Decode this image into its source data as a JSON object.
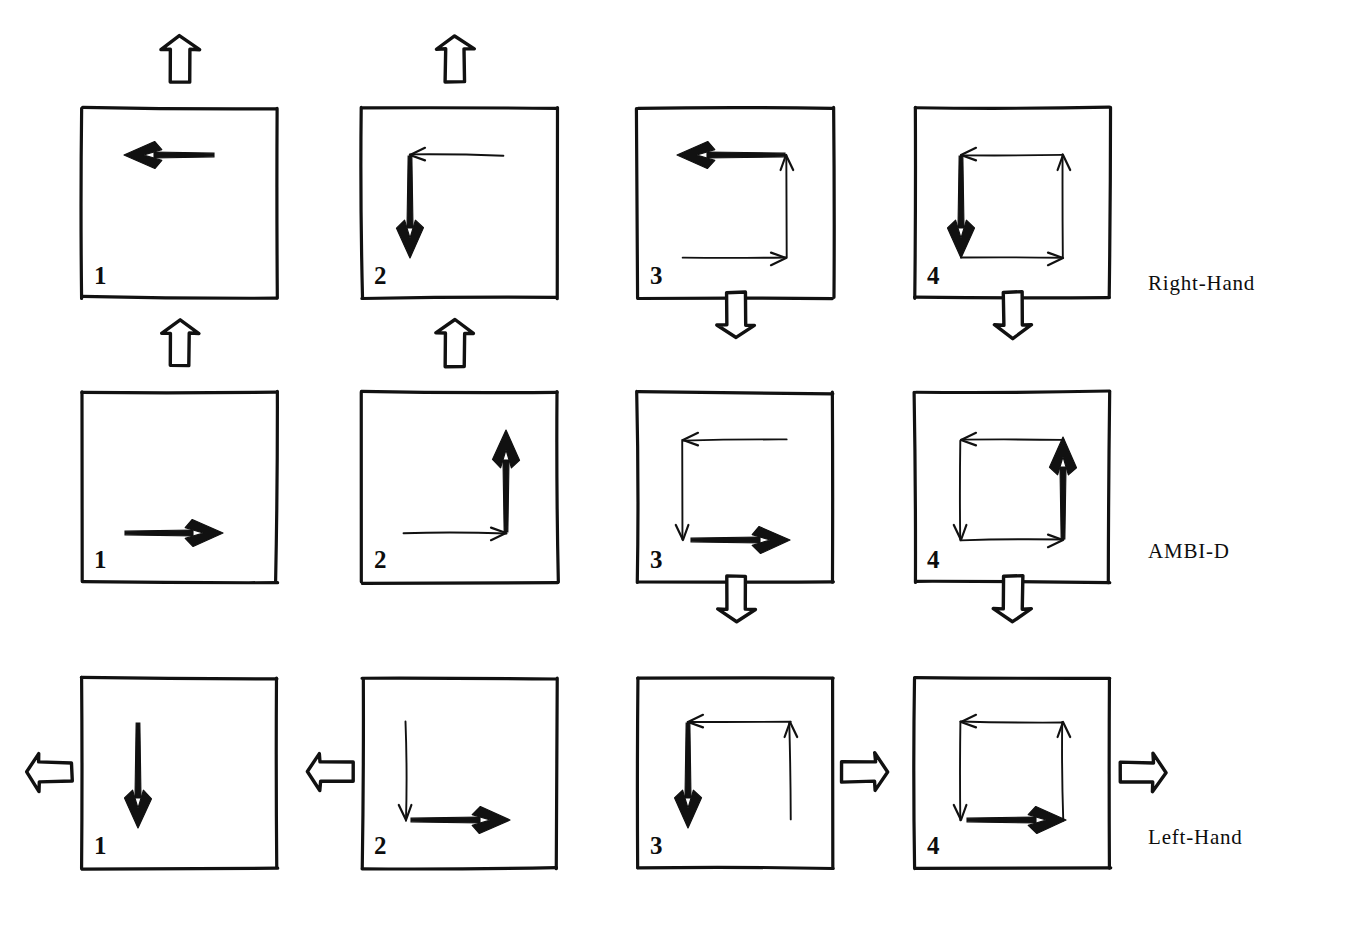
{
  "figure": {
    "background_color": "#ffffff",
    "ink_color": "#111111",
    "rows": [
      {
        "id": "row-right-hand",
        "label": "Right-Hand",
        "label_x": 1148,
        "label_y": 284,
        "panel_top": 108,
        "panel_height": 190,
        "chirality": "right",
        "transition_arrows_below": [
          {
            "panel_index": 3,
            "x": 736,
            "y": 312,
            "direction": "down"
          },
          {
            "panel_index": 4,
            "x": 1013,
            "y": 312,
            "direction": "down"
          }
        ],
        "panels": [
          {
            "number": "1",
            "x": 82,
            "width": 195,
            "top_arrow": {
              "direction": "up",
              "x": 180,
              "y": 62
            },
            "strokes": [
              {
                "kind": "thick",
                "dir": "left",
                "x1": 215,
                "y1": 155,
                "x2": 124,
                "y2": 155
              }
            ]
          },
          {
            "number": "2",
            "x": 362,
            "width": 195,
            "top_arrow": {
              "direction": "up",
              "x": 455,
              "y": 62
            },
            "strokes": [
              {
                "kind": "thin",
                "dir": "left",
                "x1": 503,
                "y1": 155,
                "x2": 410,
                "y2": 155
              },
              {
                "kind": "thick",
                "dir": "down",
                "x1": 410,
                "y1": 155,
                "x2": 410,
                "y2": 258
              }
            ]
          },
          {
            "number": "3",
            "x": 638,
            "width": 195,
            "top_arrow": null,
            "strokes": [
              {
                "kind": "thin",
                "dir": "right",
                "x1": 683,
                "y1": 258,
                "x2": 786,
                "y2": 258
              },
              {
                "kind": "thin",
                "dir": "up",
                "x1": 786,
                "y1": 258,
                "x2": 786,
                "y2": 155
              },
              {
                "kind": "thick",
                "dir": "left",
                "x1": 786,
                "y1": 155,
                "x2": 677,
                "y2": 155
              }
            ]
          },
          {
            "number": "4",
            "x": 915,
            "width": 195,
            "top_arrow": null,
            "strokes": [
              {
                "kind": "thin",
                "dir": "right",
                "x1": 961,
                "y1": 258,
                "x2": 1063,
                "y2": 258
              },
              {
                "kind": "thin",
                "dir": "up",
                "x1": 1063,
                "y1": 258,
                "x2": 1063,
                "y2": 155
              },
              {
                "kind": "thin",
                "dir": "left",
                "x1": 1063,
                "y1": 155,
                "x2": 961,
                "y2": 155
              },
              {
                "kind": "thick",
                "dir": "down",
                "x1": 961,
                "y1": 155,
                "x2": 961,
                "y2": 258
              }
            ]
          }
        ]
      },
      {
        "id": "row-ambi-d",
        "label": "AMBI-D",
        "label_x": 1148,
        "label_y": 552,
        "panel_top": 392,
        "panel_height": 190,
        "chirality": "ambidextrous",
        "transition_arrows_below": [
          {
            "panel_index": 3,
            "x": 736,
            "y": 596,
            "direction": "down"
          },
          {
            "panel_index": 4,
            "x": 1013,
            "y": 596,
            "direction": "down"
          }
        ],
        "panels": [
          {
            "number": "1",
            "x": 82,
            "width": 195,
            "top_arrow": {
              "direction": "up",
              "x": 180,
              "y": 346
            },
            "strokes": [
              {
                "kind": "thick",
                "dir": "right",
                "x1": 124,
                "y1": 533,
                "x2": 223,
                "y2": 533
              }
            ]
          },
          {
            "number": "2",
            "x": 362,
            "width": 195,
            "top_arrow": {
              "direction": "up",
              "x": 455,
              "y": 346
            },
            "strokes": [
              {
                "kind": "thin",
                "dir": "right",
                "x1": 403,
                "y1": 533,
                "x2": 506,
                "y2": 533
              },
              {
                "kind": "thick",
                "dir": "up",
                "x1": 506,
                "y1": 533,
                "x2": 506,
                "y2": 430
              }
            ]
          },
          {
            "number": "3",
            "x": 638,
            "width": 195,
            "top_arrow": null,
            "strokes": [
              {
                "kind": "thin",
                "dir": "left",
                "x1": 786,
                "y1": 440,
                "x2": 683,
                "y2": 440
              },
              {
                "kind": "thin",
                "dir": "down",
                "x1": 683,
                "y1": 440,
                "x2": 683,
                "y2": 540
              },
              {
                "kind": "thick",
                "dir": "right",
                "x1": 690,
                "y1": 540,
                "x2": 790,
                "y2": 540
              }
            ]
          },
          {
            "number": "4",
            "x": 915,
            "width": 195,
            "top_arrow": null,
            "strokes": [
              {
                "kind": "thin",
                "dir": "left",
                "x1": 1063,
                "y1": 440,
                "x2": 961,
                "y2": 440
              },
              {
                "kind": "thin",
                "dir": "down",
                "x1": 961,
                "y1": 440,
                "x2": 961,
                "y2": 540
              },
              {
                "kind": "thin",
                "dir": "right",
                "x1": 961,
                "y1": 540,
                "x2": 1063,
                "y2": 540
              },
              {
                "kind": "thick",
                "dir": "up",
                "x1": 1063,
                "y1": 540,
                "x2": 1063,
                "y2": 437
              }
            ]
          }
        ]
      },
      {
        "id": "row-left-hand",
        "label": "Left-Hand",
        "label_x": 1148,
        "label_y": 838,
        "panel_top": 678,
        "panel_height": 190,
        "chirality": "left",
        "transition_arrows_below": [],
        "panels": [
          {
            "number": "1",
            "x": 82,
            "width": 195,
            "top_arrow": null,
            "side_arrow": {
              "direction": "left",
              "x": 52,
              "y": 772
            },
            "strokes": [
              {
                "kind": "thick",
                "dir": "down",
                "x1": 138,
                "y1": 722,
                "x2": 138,
                "y2": 828
              }
            ]
          },
          {
            "number": "2",
            "x": 362,
            "width": 195,
            "top_arrow": null,
            "side_arrow": {
              "direction": "left",
              "x": 333,
              "y": 772
            },
            "strokes": [
              {
                "kind": "thin",
                "dir": "down",
                "x1": 406,
                "y1": 722,
                "x2": 406,
                "y2": 820
              },
              {
                "kind": "thick",
                "dir": "right",
                "x1": 410,
                "y1": 820,
                "x2": 510,
                "y2": 820
              }
            ]
          },
          {
            "number": "3",
            "x": 638,
            "width": 195,
            "top_arrow": null,
            "side_arrow": {
              "direction": "right",
              "x": 862,
              "y": 772
            },
            "strokes": [
              {
                "kind": "thin",
                "dir": "up",
                "x1": 790,
                "y1": 820,
                "x2": 790,
                "y2": 722
              },
              {
                "kind": "thin",
                "dir": "left",
                "x1": 790,
                "y1": 722,
                "x2": 688,
                "y2": 722
              },
              {
                "kind": "thick",
                "dir": "down",
                "x1": 688,
                "y1": 722,
                "x2": 688,
                "y2": 828
              }
            ]
          },
          {
            "number": "4",
            "x": 915,
            "width": 195,
            "top_arrow": null,
            "side_arrow": {
              "direction": "right",
              "x": 1140,
              "y": 772
            },
            "strokes": [
              {
                "kind": "thin",
                "dir": "up",
                "x1": 1063,
                "y1": 820,
                "x2": 1063,
                "y2": 722
              },
              {
                "kind": "thin",
                "dir": "left",
                "x1": 1063,
                "y1": 722,
                "x2": 961,
                "y2": 722
              },
              {
                "kind": "thin",
                "dir": "down",
                "x1": 961,
                "y1": 722,
                "x2": 961,
                "y2": 820
              },
              {
                "kind": "thick",
                "dir": "right",
                "x1": 966,
                "y1": 820,
                "x2": 1066,
                "y2": 820
              }
            ]
          }
        ]
      }
    ],
    "legend": {
      "thick_stroke_meaning": "current step",
      "thin_stroke_meaning": "previous steps",
      "hollow_arrow_meaning": "transition to next state"
    }
  }
}
